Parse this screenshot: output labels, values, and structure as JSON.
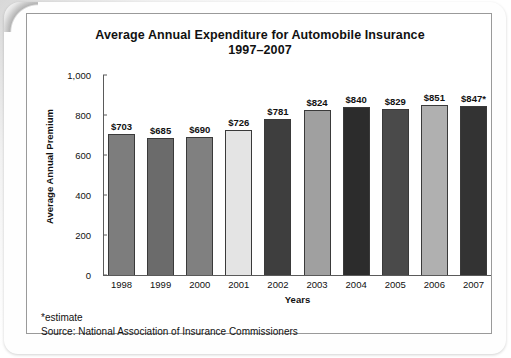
{
  "chart_data": {
    "type": "bar",
    "title": "Average Annual Expenditure for Automobile Insurance 1997–2007",
    "title_line1": "Average Annual Expenditure for Automobile Insurance",
    "title_line2": "1997–2007",
    "xlabel": "Years",
    "ylabel": "Average Annual Premium",
    "ylim": [
      0,
      1000
    ],
    "ytick_labels": [
      "1,000",
      "800",
      "600",
      "400",
      "200",
      "0"
    ],
    "ytick_values": [
      1000,
      800,
      600,
      400,
      200,
      0
    ],
    "grid": false,
    "legend": "none",
    "categories": [
      "1998",
      "1999",
      "2000",
      "2001",
      "2002",
      "2003",
      "2004",
      "2005",
      "2006",
      "2007"
    ],
    "values": [
      703,
      685,
      690,
      726,
      781,
      824,
      840,
      829,
      851,
      847
    ],
    "data_labels": [
      "$703",
      "$685",
      "$690",
      "$726",
      "$781",
      "$824",
      "$840",
      "$829",
      "$851",
      "$847*"
    ],
    "bar_colors": [
      "#7d7d7d",
      "#6b6b6b",
      "#808080",
      "#e4e4e4",
      "#3e3e3e",
      "#a0a0a0",
      "#2c2c2c",
      "#4a4a4a",
      "#b0b0b0",
      "#333333"
    ],
    "annotations": [
      "*estimate"
    ],
    "source": "Source: National Association of Insurance Commissioners"
  },
  "footnotes": {
    "estimate_note": "*estimate",
    "source_note": "Source: National Association of Insurance Commissioners"
  }
}
